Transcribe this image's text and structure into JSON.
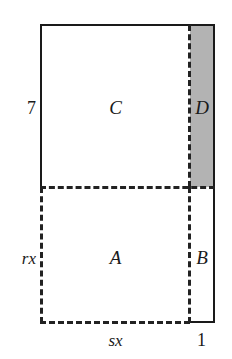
{
  "figure": {
    "canvas": {
      "width": 232,
      "height": 359
    },
    "colors": {
      "stroke": "#1a1a1a",
      "dashed_stroke": "#222222",
      "shade_fill": "#b3b3b3",
      "background": "#ffffff"
    },
    "regions": [
      {
        "key": "C",
        "label": "C",
        "description": "upper-left unshaded rectangle",
        "shaded": false,
        "x": 41,
        "y": 25,
        "width": 149,
        "height": 162
      },
      {
        "key": "D",
        "label": "D",
        "description": "upper-right shaded strip",
        "shaded": true,
        "x": 190,
        "y": 25,
        "width": 24,
        "height": 162
      },
      {
        "key": "A",
        "label": "A",
        "description": "lower-left unshaded rectangle",
        "shaded": false,
        "x": 41,
        "y": 187,
        "width": 149,
        "height": 134
      },
      {
        "key": "B",
        "label": "B",
        "description": "lower-right unshaded strip",
        "shaded": false,
        "x": 190,
        "y": 187,
        "width": 24,
        "height": 134
      }
    ],
    "dimensions": [
      {
        "key": "left_top",
        "label": "7",
        "style": "upright",
        "side": "left",
        "measures": "height of region C"
      },
      {
        "key": "left_bottom",
        "label": "rx",
        "style": "italic",
        "side": "left",
        "measures": "height of region A"
      },
      {
        "key": "bottom_left",
        "label": "sx",
        "style": "italic",
        "side": "bottom",
        "measures": "width of regions A and C"
      },
      {
        "key": "bottom_right",
        "label": "1",
        "style": "upright",
        "side": "bottom",
        "measures": "width of regions B and D"
      }
    ]
  }
}
